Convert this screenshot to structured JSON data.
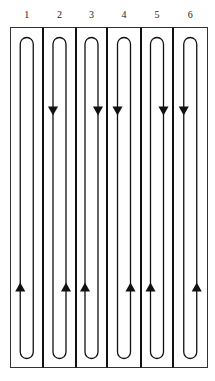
{
  "diagram": {
    "title": "",
    "lanes": [
      {
        "label": "1",
        "down_arrow": false,
        "up_arrow_side": "left"
      },
      {
        "label": "2",
        "down_arrow": true,
        "down_arrow_side": "left",
        "up_arrow_side": "right"
      },
      {
        "label": "3",
        "down_arrow": true,
        "down_arrow_side": "right",
        "up_arrow_side": "left"
      },
      {
        "label": "4",
        "down_arrow": true,
        "down_arrow_side": "left",
        "up_arrow_side": "right"
      },
      {
        "label": "5",
        "down_arrow": true,
        "down_arrow_side": "right",
        "up_arrow_side": "left"
      },
      {
        "label": "6",
        "down_arrow": true,
        "down_arrow_side": "left",
        "up_arrow_side": "right"
      }
    ],
    "colors": {
      "stroke": "#111111",
      "background": "#ffffff"
    }
  }
}
